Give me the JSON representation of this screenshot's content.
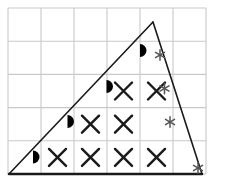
{
  "figure": {
    "canvas": {
      "width": 228,
      "height": 182
    },
    "background_color": "#ffffff"
  },
  "grid": {
    "line_color": "#c9c9c9",
    "line_width": 1.1,
    "columns": 6,
    "rows": 5,
    "cell_width": 33,
    "cell_height": 33.2,
    "origin_x": 8,
    "origin_y": 8,
    "x_lines": [
      8,
      41,
      74,
      107,
      140,
      173,
      206
    ],
    "y_lines": [
      8,
      41.2,
      74.4,
      107.6,
      140.8,
      174
    ]
  },
  "triangle": {
    "stroke_color": "#1a1a1a",
    "stroke_width": 1.6,
    "base_stroke_width": 2.6,
    "vertices": [
      {
        "name": "bottom-left",
        "x": 9,
        "y": 174
      },
      {
        "name": "apex",
        "x": 153,
        "y": 22
      },
      {
        "name": "bottom-right",
        "x": 202,
        "y": 174
      }
    ]
  },
  "markers": {
    "cross": {
      "symbol_name": "cross-x",
      "color": "#1a1a1a",
      "stroke_width": 2.4,
      "arm": 8.5,
      "count": 8,
      "positions": [
        {
          "row": 2,
          "col": 4,
          "x": 123.5,
          "y": 91
        },
        {
          "row": 3,
          "col": 3,
          "x": 90.5,
          "y": 124.2
        },
        {
          "row": 3,
          "col": 4,
          "x": 123.5,
          "y": 124.2
        },
        {
          "row": 4,
          "col": 2,
          "x": 57.5,
          "y": 157.4
        },
        {
          "row": 4,
          "col": 3,
          "x": 90.5,
          "y": 157.4
        },
        {
          "row": 4,
          "col": 4,
          "x": 123.5,
          "y": 157.4
        },
        {
          "row": 4,
          "col": 5,
          "x": 156.5,
          "y": 157.4
        },
        {
          "row": 1,
          "col": 5,
          "x": 156.5,
          "y": 91
        }
      ]
    },
    "half_moon": {
      "symbol_name": "half-moon-filled",
      "color": "#000000",
      "radius": 6.5,
      "flat_edge": "left",
      "count": 4,
      "positions": [
        {
          "row": 0,
          "col": 4,
          "x": 140.0,
          "y": 50.5
        },
        {
          "row": 1,
          "col": 3,
          "x": 106.5,
          "y": 86.5
        },
        {
          "row": 2,
          "col": 2,
          "x": 67.5,
          "y": 121.5
        },
        {
          "row": 3,
          "col": 1,
          "x": 33.0,
          "y": 157.0
        }
      ]
    },
    "asterisk": {
      "symbol_name": "asterisk-six-point",
      "color": "#555555",
      "stroke_width": 1.5,
      "arm": 5.2,
      "count": 4,
      "positions": [
        {
          "row": 0,
          "col": 5,
          "x": 160.0,
          "y": 55.0
        },
        {
          "row": 1,
          "col": 5,
          "x": 164.5,
          "y": 88.5
        },
        {
          "row": 2,
          "col": 5,
          "x": 170.0,
          "y": 122.0
        },
        {
          "row": 3,
          "col": 6,
          "x": 198.0,
          "y": 168.0
        }
      ]
    }
  },
  "legend_note": {
    "cross_meaning": "cell fully inside triangle",
    "half_moon_meaning": "cell partially cut by hypotenuse",
    "asterisk_meaning": "cell partially cut by right edge"
  }
}
